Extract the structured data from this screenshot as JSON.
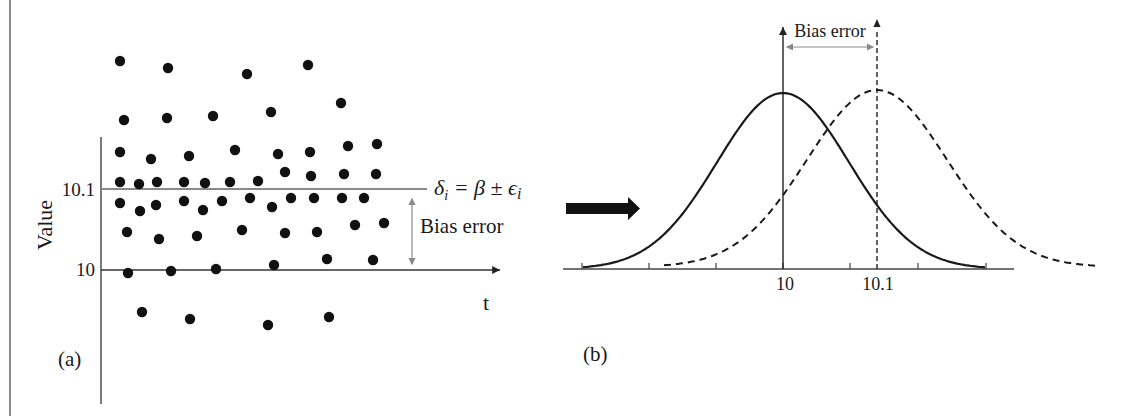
{
  "panel_a": {
    "label": "(a)",
    "y_axis_label": "Value",
    "x_axis_label": "t",
    "tick_labels": {
      "upper": "10.1",
      "lower": "10"
    },
    "equation": {
      "lhs": "δ",
      "lhs_sub": "i",
      "rhs": " = β ± ϵ",
      "rhs_sub": "i"
    },
    "bias_annotation": "Bias error",
    "colors": {
      "reference_line": "#8a8a8a",
      "dots": "#111111",
      "axes": "#333333"
    },
    "dots": [
      [
        120,
        61
      ],
      [
        168,
        68
      ],
      [
        247,
        74
      ],
      [
        308,
        65
      ],
      [
        124,
        120
      ],
      [
        167,
        118
      ],
      [
        213,
        116
      ],
      [
        271,
        112
      ],
      [
        341,
        103
      ],
      [
        120,
        152
      ],
      [
        151,
        159
      ],
      [
        189,
        156
      ],
      [
        235,
        150
      ],
      [
        278,
        154
      ],
      [
        310,
        152
      ],
      [
        348,
        146
      ],
      [
        377,
        144
      ],
      [
        285,
        172
      ],
      [
        311,
        176
      ],
      [
        344,
        174
      ],
      [
        376,
        174
      ],
      [
        120,
        182
      ],
      [
        139,
        184
      ],
      [
        157,
        182
      ],
      [
        184,
        182
      ],
      [
        205,
        183
      ],
      [
        230,
        182
      ],
      [
        258,
        181
      ],
      [
        120,
        203
      ],
      [
        140,
        211
      ],
      [
        156,
        205
      ],
      [
        184,
        201
      ],
      [
        203,
        210
      ],
      [
        222,
        201
      ],
      [
        250,
        198
      ],
      [
        272,
        207
      ],
      [
        291,
        198
      ],
      [
        314,
        198
      ],
      [
        342,
        198
      ],
      [
        364,
        198
      ],
      [
        127,
        232
      ],
      [
        159,
        239
      ],
      [
        197,
        236
      ],
      [
        242,
        230
      ],
      [
        285,
        233
      ],
      [
        317,
        232
      ],
      [
        355,
        225
      ],
      [
        384,
        223
      ],
      [
        327,
        259
      ],
      [
        373,
        260
      ],
      [
        128,
        273
      ],
      [
        171,
        271
      ],
      [
        216,
        269
      ],
      [
        274,
        265
      ],
      [
        142,
        312
      ],
      [
        190,
        319
      ],
      [
        268,
        325
      ],
      [
        329,
        317
      ]
    ]
  },
  "panel_b": {
    "label": "(b)",
    "bias_annotation": "Bias error",
    "tick_labels": {
      "true_mean": "10",
      "biased_mean": "10.1"
    },
    "curves": [
      {
        "name": "true distribution",
        "style": "solid",
        "mean_px": 783,
        "sigma_px": 66,
        "peak_y": 93
      },
      {
        "name": "biased distribution",
        "style": "dashed",
        "mean_px": 877,
        "sigma_px": 70,
        "peak_y": 90
      }
    ],
    "baseline": {
      "y": 269,
      "x_start": 563,
      "x_end": 1014,
      "ticks": [
        582,
        649,
        716,
        783,
        850,
        918,
        986
      ]
    },
    "colors": {
      "curve": "#1a1a1a",
      "annotation_arrow": "#8a8a8a",
      "baseline": "#444444"
    }
  },
  "transition_arrow": {
    "direction": "right",
    "color": "#111111"
  }
}
